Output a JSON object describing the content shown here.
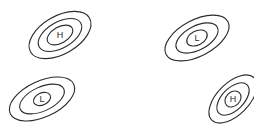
{
  "diagram": {
    "width": 254,
    "height": 137,
    "background": "#ffffff",
    "stroke_color": "#2b2b2b",
    "systems": [
      {
        "id": "high-top-left",
        "type": "high",
        "label": "H",
        "center": [
          60,
          35
        ],
        "rotation": -30,
        "rings": [
          {
            "rx": 34,
            "ry": 19
          },
          {
            "rx": 24,
            "ry": 13
          },
          {
            "rx": 14,
            "ry": 8
          }
        ]
      },
      {
        "id": "low-top-right",
        "type": "low",
        "label": "L",
        "center": [
          197,
          38
        ],
        "rotation": -28,
        "rings": [
          {
            "rx": 35,
            "ry": 18
          },
          {
            "rx": 23,
            "ry": 12
          },
          {
            "rx": 11,
            "ry": 7
          }
        ]
      },
      {
        "id": "low-bottom-left",
        "type": "low",
        "label": "L",
        "center": [
          42,
          99
        ],
        "rotation": -25,
        "rings": [
          {
            "rx": 35,
            "ry": 18
          },
          {
            "rx": 24,
            "ry": 12
          },
          {
            "rx": 9,
            "ry": 6
          }
        ]
      },
      {
        "id": "high-bottom-right",
        "type": "high",
        "label": "H",
        "center": [
          233,
          99
        ],
        "rotation": -45,
        "rings": [
          {
            "rx": 30,
            "ry": 16
          },
          {
            "rx": 20,
            "ry": 11
          },
          {
            "rx": 9,
            "ry": 7
          }
        ]
      }
    ]
  }
}
